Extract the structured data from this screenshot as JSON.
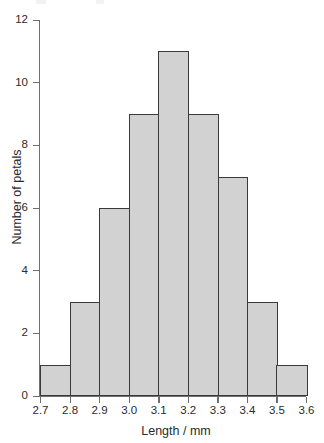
{
  "chart_data": {
    "type": "bar",
    "title": "",
    "subtitle": "",
    "xlabel": "Length / mm",
    "ylabel": "Number of petals",
    "categories": [
      "2.7-2.8",
      "2.8-2.9",
      "2.9-3.0",
      "3.0-3.1",
      "3.1-3.2",
      "3.2-3.3",
      "3.3-3.4",
      "3.4-3.5",
      "3.5-3.6"
    ],
    "bin_edges": [
      2.7,
      2.8,
      2.9,
      3.0,
      3.1,
      3.2,
      3.3,
      3.4,
      3.5,
      3.6
    ],
    "values": [
      1,
      3,
      6,
      9,
      11,
      9,
      7,
      3,
      1
    ],
    "xlim": [
      2.7,
      3.6
    ],
    "ylim": [
      0,
      12
    ],
    "x_ticks": [
      "2.7",
      "2.8",
      "2.9",
      "3.0",
      "3.1",
      "3.2",
      "3.3",
      "3.4",
      "3.5",
      "3.6"
    ],
    "y_ticks": [
      "0",
      "2",
      "4",
      "6",
      "8",
      "10",
      "12"
    ],
    "y_tick_values": [
      0,
      2,
      4,
      6,
      8,
      10,
      12
    ],
    "grid": false,
    "legend": null,
    "bar_fill_color": "#d2d2d2",
    "bar_edge_color": "#3a3a3a",
    "axis_color": "#6e6e6e",
    "total_count": 50
  }
}
